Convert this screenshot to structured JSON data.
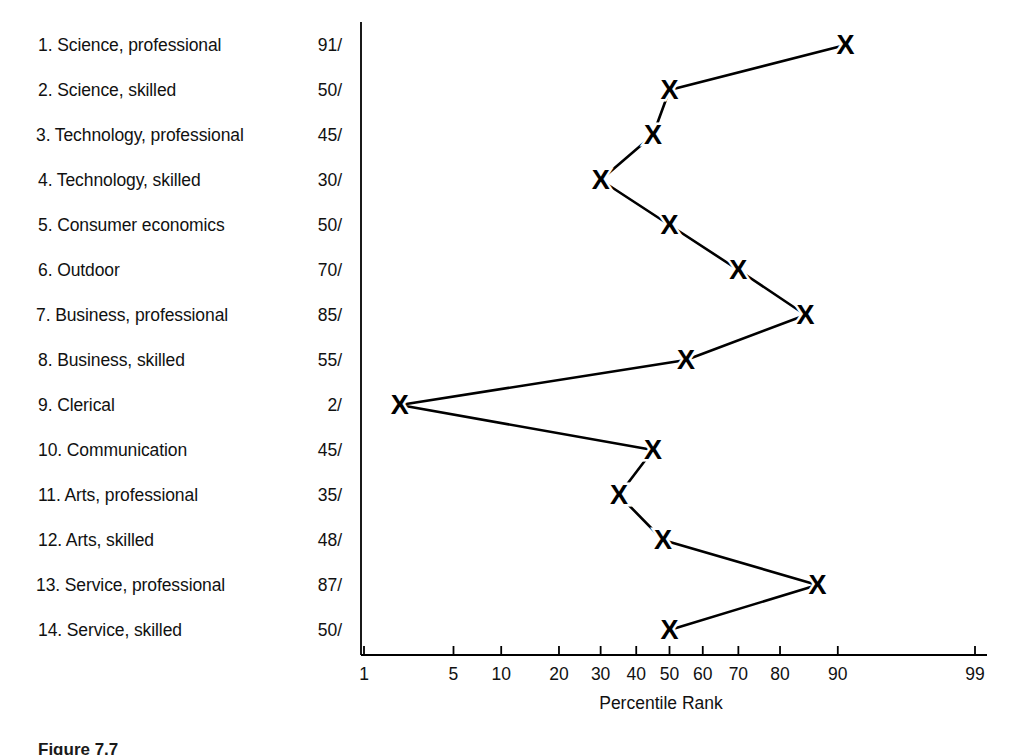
{
  "figure": {
    "caption": "Figure 7.7",
    "axis_title": "Percentile Rank"
  },
  "chart_data": {
    "type": "line",
    "title": "",
    "xlabel": "Percentile Rank",
    "ylabel": "",
    "orientation": "horizontal",
    "x_scale": "normal-probability",
    "xlim": [
      1,
      99
    ],
    "grid": false,
    "legend": null,
    "marker": "X",
    "line_color": "#000000",
    "marker_color": "#000000",
    "value_suffix": "/",
    "x_ticks": [
      {
        "label": "1",
        "value": 1
      },
      {
        "label": "5",
        "value": 5
      },
      {
        "label": "10",
        "value": 10
      },
      {
        "label": "20",
        "value": 20
      },
      {
        "label": "30",
        "value": 30
      },
      {
        "label": "40",
        "value": 40
      },
      {
        "label": "50",
        "value": 50
      },
      {
        "label": "60",
        "value": 60
      },
      {
        "label": "70",
        "value": 70
      },
      {
        "label": "80",
        "value": 80
      },
      {
        "label": "90",
        "value": 90
      },
      {
        "label": "99",
        "value": 99
      }
    ],
    "categories": [
      "1. Science, professional",
      "2. Science, skilled",
      "3. Technology, professional",
      "4. Technology, skilled",
      "5. Consumer economics",
      "6. Outdoor",
      "7. Business, professional",
      "8. Business, skilled",
      "9. Clerical",
      "10. Communication",
      "11. Arts, professional",
      "12. Arts, skilled",
      "13. Service, professional",
      "14. Service, skilled"
    ],
    "values": [
      91,
      50,
      45,
      30,
      50,
      70,
      85,
      55,
      2,
      45,
      35,
      48,
      87,
      50
    ],
    "rows": [
      {
        "index": 1,
        "label": "1. Science, professional",
        "value": 91,
        "value_text": "91/"
      },
      {
        "index": 2,
        "label": "2. Science, skilled",
        "value": 50,
        "value_text": "50/"
      },
      {
        "index": 3,
        "label": "3. Technology, professional",
        "value": 45,
        "value_text": "45/"
      },
      {
        "index": 4,
        "label": "4. Technology, skilled",
        "value": 30,
        "value_text": "30/"
      },
      {
        "index": 5,
        "label": "5. Consumer economics",
        "value": 50,
        "value_text": "50/"
      },
      {
        "index": 6,
        "label": "6. Outdoor",
        "value": 70,
        "value_text": "70/"
      },
      {
        "index": 7,
        "label": "7. Business, professional",
        "value": 85,
        "value_text": "85/"
      },
      {
        "index": 8,
        "label": "8. Business, skilled",
        "value": 55,
        "value_text": "55/"
      },
      {
        "index": 9,
        "label": "9. Clerical",
        "value": 2,
        "value_text": "2/"
      },
      {
        "index": 10,
        "label": "10. Communication",
        "value": 45,
        "value_text": "45/"
      },
      {
        "index": 11,
        "label": "11. Arts, professional",
        "value": 35,
        "value_text": "35/"
      },
      {
        "index": 12,
        "label": "12. Arts, skilled",
        "value": 48,
        "value_text": "48/"
      },
      {
        "index": 13,
        "label": "13. Service, professional",
        "value": 87,
        "value_text": "87/"
      },
      {
        "index": 14,
        "label": "14. Service, skilled",
        "value": 50,
        "value_text": "50/"
      }
    ]
  }
}
